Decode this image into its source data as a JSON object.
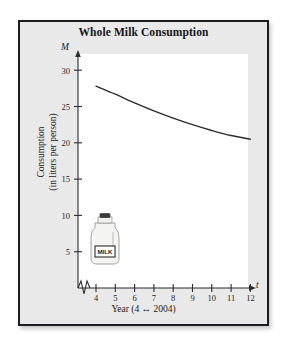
{
  "figure": {
    "title": "Whole Milk Consumption",
    "background_color": "#e9e9e9",
    "plot_background_color": "#ffffff",
    "border_color": "#1c1c22"
  },
  "chart_data": {
    "type": "line",
    "title": "Whole Milk Consumption",
    "xlabel": "Year (4 ↔ 2004)",
    "ylabel": "Consumption\n(in liters per person)",
    "ylabel_line1": "Consumption",
    "ylabel_line2": "(in liters per person)",
    "x_axis_variable": "t",
    "y_axis_variable": "M",
    "xlim": [
      3.4,
      12.6
    ],
    "ylim": [
      0,
      32
    ],
    "x_ticks": [
      4,
      5,
      6,
      7,
      8,
      9,
      10,
      11,
      12
    ],
    "x_tick_labels": [
      "4",
      "5",
      "6",
      "7",
      "8",
      "9",
      "10",
      "11",
      "12"
    ],
    "y_ticks": [
      5,
      10,
      15,
      20,
      25,
      30
    ],
    "y_tick_labels": [
      "5",
      "10",
      "15",
      "20",
      "25",
      "30"
    ],
    "axis_break": true,
    "grid": false,
    "legend": false,
    "x": [
      4,
      5,
      6,
      7,
      8,
      9,
      10,
      11,
      12
    ],
    "values": [
      27.8,
      26.7,
      25.5,
      24.4,
      23.4,
      22.5,
      21.7,
      21.0,
      20.5
    ],
    "series": [
      {
        "name": "Whole milk consumption",
        "x": [
          4,
          5,
          6,
          7,
          8,
          9,
          10,
          11,
          12
        ],
        "values": [
          27.8,
          26.7,
          25.5,
          24.4,
          23.4,
          22.5,
          21.7,
          21.0,
          20.5
        ],
        "line_color": "#2b2b30",
        "line_width": 1.4
      }
    ]
  },
  "illustration": {
    "name": "milk-jug",
    "label_text": "MILK",
    "cap_color": "#3a3a3a",
    "body_color": "#f4f4f2"
  }
}
